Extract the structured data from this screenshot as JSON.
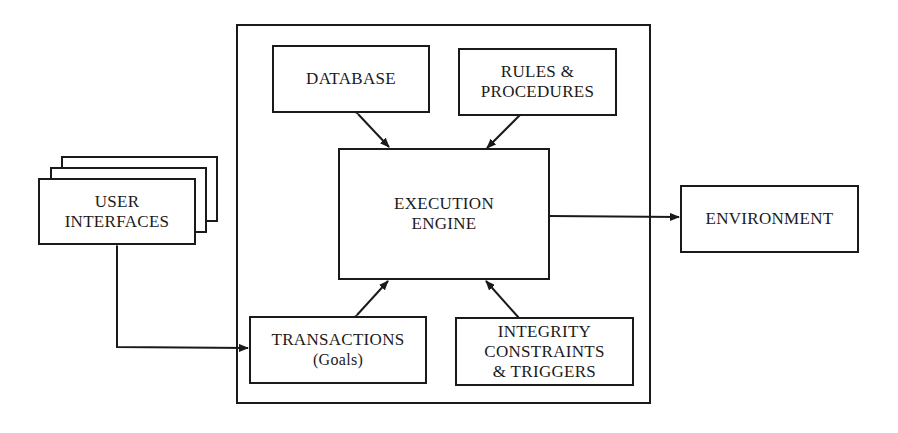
{
  "diagram": {
    "type": "architecture-block-diagram",
    "container": {
      "label": ""
    },
    "nodes": {
      "database": {
        "lines": [
          "DATABASE"
        ]
      },
      "rules": {
        "lines": [
          "RULES &",
          "PROCEDURES"
        ]
      },
      "engine": {
        "lines": [
          "EXECUTION",
          "ENGINE"
        ]
      },
      "transactions": {
        "lines": [
          "TRANSACTIONS",
          "(Goals)"
        ]
      },
      "integrity": {
        "lines": [
          "INTEGRITY",
          "CONSTRAINTS",
          "& TRIGGERS"
        ]
      },
      "user_interfaces": {
        "lines": [
          "USER",
          "INTERFACES"
        ],
        "stacked": 3
      },
      "environment": {
        "lines": [
          "ENVIRONMENT"
        ]
      }
    },
    "edges": [
      {
        "from": "database",
        "to": "engine",
        "direction": "bidirectional"
      },
      {
        "from": "rules",
        "to": "engine",
        "direction": "forward"
      },
      {
        "from": "engine",
        "to": "environment",
        "direction": "forward"
      },
      {
        "from": "transactions",
        "to": "engine",
        "direction": "bidirectional"
      },
      {
        "from": "integrity",
        "to": "engine",
        "direction": "forward"
      },
      {
        "from": "user_interfaces",
        "to": "transactions",
        "direction": "bidirectional"
      }
    ]
  }
}
